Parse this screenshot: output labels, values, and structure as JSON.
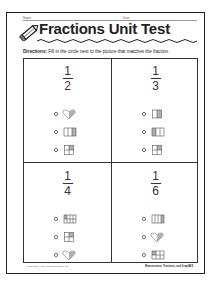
{
  "header": {
    "name_label": "Name",
    "date_label": "Date",
    "title": "Fractions Unit Test"
  },
  "directions": {
    "label": "Directions:",
    "text": " Fill in the circle next to the picture that matches the fraction."
  },
  "questions": [
    {
      "numerator": "1",
      "denominator": "2",
      "options": [
        {
          "picture": "heart-half-shaded-icon"
        },
        {
          "picture": "rectangle-thirds-one-shaded-icon"
        },
        {
          "picture": "square-quarters-one-shaded-icon"
        }
      ]
    },
    {
      "numerator": "1",
      "denominator": "3",
      "options": [
        {
          "picture": "square-halves-one-shaded-icon"
        },
        {
          "picture": "rectangle-thirds-one-shaded-icon"
        },
        {
          "picture": "square-quarters-one-shaded-icon"
        }
      ]
    },
    {
      "numerator": "1",
      "denominator": "4",
      "options": [
        {
          "picture": "rectangle-eighths-one-shaded-icon"
        },
        {
          "picture": "square-quarters-one-shaded-icon"
        },
        {
          "picture": "heart-half-shaded-icon"
        }
      ]
    },
    {
      "numerator": "1",
      "denominator": "6",
      "options": [
        {
          "picture": "rectangle-fourths-one-shaded-icon"
        },
        {
          "picture": "heart-half-shaded-icon"
        },
        {
          "picture": "rectangle-sixths-one-shaded-icon"
        }
      ]
    }
  ],
  "footer": {
    "copyright": "Copyright © The Learning Works, Inc.",
    "book_title": "Measurement, Fractions, and Graphs",
    "page_number": "51"
  },
  "colors": {
    "ink": "#222222",
    "shade": "#b0b0b0"
  }
}
